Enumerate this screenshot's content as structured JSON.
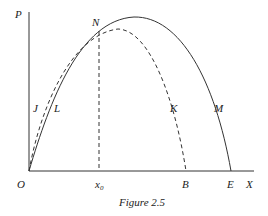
{
  "figure": {
    "caption": "Figure 2.5",
    "axes": {
      "y_label": "P",
      "x_label": "X",
      "origin_label": "O"
    },
    "points": {
      "N": "N",
      "x0": "x",
      "x0_sub": "0",
      "B": "B",
      "E": "E"
    },
    "curves": {
      "solid": {
        "labels": [
          "L",
          "M"
        ],
        "style": "solid"
      },
      "dashed": {
        "labels": [
          "J",
          "K"
        ],
        "style": "dashed"
      }
    },
    "colors": {
      "stroke": "#333333",
      "text": "#222222"
    }
  }
}
